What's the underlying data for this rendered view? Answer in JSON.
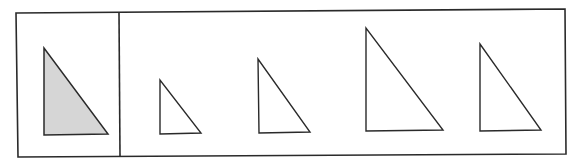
{
  "figure": {
    "colors": {
      "stroke": "#2a2a2a",
      "reference_fill": "#d6d6d6",
      "candidate_fill": "#ffffff",
      "background": "#ffffff"
    },
    "frame": {
      "outer": [
        [
          16,
          13
        ],
        [
          565,
          9
        ],
        [
          566,
          154
        ],
        [
          18,
          157
        ]
      ],
      "divider": [
        [
          119,
          13
        ],
        [
          120,
          156
        ]
      ]
    },
    "reference": {
      "label": "reference-triangle",
      "points": [
        [
          44,
          48
        ],
        [
          44,
          135
        ],
        [
          108,
          134
        ]
      ]
    },
    "candidates": [
      {
        "label": "candidate-1",
        "points": [
          [
            160,
            80
          ],
          [
            160,
            134
          ],
          [
            201,
            133
          ]
        ]
      },
      {
        "label": "candidate-2",
        "points": [
          [
            258,
            59
          ],
          [
            259,
            133
          ],
          [
            310,
            132
          ]
        ]
      },
      {
        "label": "candidate-3",
        "points": [
          [
            366,
            28
          ],
          [
            366,
            131
          ],
          [
            443,
            130
          ]
        ]
      },
      {
        "label": "candidate-4",
        "points": [
          [
            480,
            44
          ],
          [
            480,
            131
          ],
          [
            541,
            130
          ]
        ]
      }
    ]
  }
}
